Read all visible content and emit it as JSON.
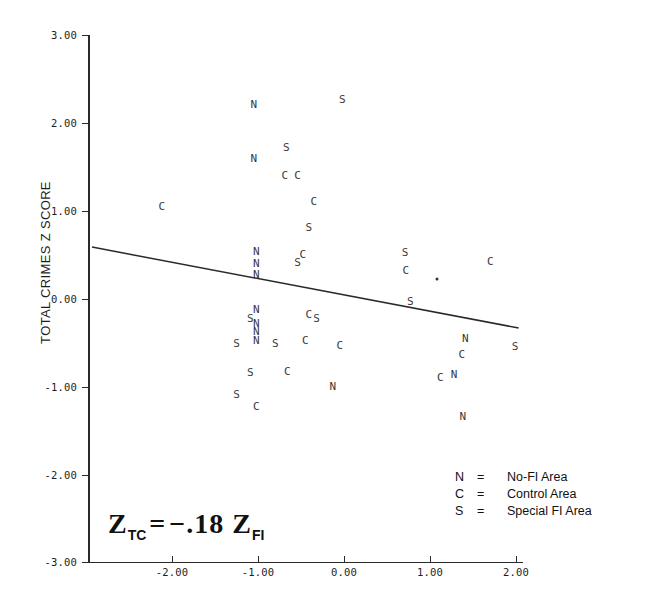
{
  "chart_data": {
    "type": "scatter",
    "title": "",
    "xlabel": "",
    "ylabel": "TOTAL CRIMES Z SCORE",
    "xlim": [
      -3.0,
      2.2
    ],
    "ylim": [
      -3.0,
      3.0
    ],
    "x_ticks": [
      "-2.00",
      "-1.00",
      "0.00",
      "1.00",
      "2.00"
    ],
    "x_tick_values": [
      -2.0,
      -1.0,
      0.0,
      1.0,
      2.0
    ],
    "y_ticks": [
      "3.00",
      "2.00",
      "1.00",
      "0.00",
      "-1.00",
      "-2.00",
      "-3.00"
    ],
    "y_tick_values": [
      3.0,
      2.0,
      1.0,
      0.0,
      -1.0,
      -2.0,
      -3.0
    ],
    "grid": false,
    "legend_position": "lower-right",
    "annotation": "Z_TC = -.18 Z_FI",
    "regression": {
      "slope": -0.18,
      "equation": "Z_TC = -.18 Z_FI",
      "x_start": -2.93,
      "y_start": 0.59,
      "x_end": 2.03,
      "y_end": -0.33
    },
    "series": [
      {
        "name": "No-FI Area",
        "marker": "N",
        "points": [
          {
            "x": -1.05,
            "y": 2.22
          },
          {
            "x": -1.05,
            "y": 1.6
          },
          {
            "x": -1.02,
            "y": 0.55
          },
          {
            "x": -1.02,
            "y": 0.41
          },
          {
            "x": -1.02,
            "y": 0.29
          },
          {
            "x": -1.02,
            "y": -0.11
          },
          {
            "x": -1.02,
            "y": -0.27
          },
          {
            "x": -1.02,
            "y": -0.36
          },
          {
            "x": -1.02,
            "y": -0.47
          },
          {
            "x": -0.13,
            "y": -0.99
          },
          {
            "x": 1.41,
            "y": -0.44
          },
          {
            "x": 1.28,
            "y": -0.85
          },
          {
            "x": 1.38,
            "y": -1.33
          }
        ]
      },
      {
        "name": "Control Area",
        "marker": "C",
        "points": [
          {
            "x": -2.12,
            "y": 1.06
          },
          {
            "x": -0.69,
            "y": 1.41
          },
          {
            "x": -0.54,
            "y": 1.41
          },
          {
            "x": -0.35,
            "y": 1.11
          },
          {
            "x": -0.48,
            "y": 0.51
          },
          {
            "x": -0.41,
            "y": -0.17
          },
          {
            "x": -0.45,
            "y": -0.46
          },
          {
            "x": -0.05,
            "y": -0.52
          },
          {
            "x": -0.66,
            "y": -0.82
          },
          {
            "x": -1.02,
            "y": -1.22
          },
          {
            "x": 0.72,
            "y": 0.33
          },
          {
            "x": 1.7,
            "y": 0.43
          },
          {
            "x": 1.37,
            "y": -0.63
          },
          {
            "x": 1.12,
            "y": -0.89
          }
        ]
      },
      {
        "name": "Special FI Area",
        "marker": "S",
        "points": [
          {
            "x": -0.02,
            "y": 2.27
          },
          {
            "x": -0.67,
            "y": 1.73
          },
          {
            "x": -0.41,
            "y": 0.82
          },
          {
            "x": -0.54,
            "y": 0.42
          },
          {
            "x": -1.09,
            "y": -0.22
          },
          {
            "x": -0.8,
            "y": -0.5
          },
          {
            "x": -0.32,
            "y": -0.21
          },
          {
            "x": -1.25,
            "y": -0.5
          },
          {
            "x": -1.09,
            "y": -0.83
          },
          {
            "x": -1.25,
            "y": -1.08
          },
          {
            "x": 0.77,
            "y": -0.02
          },
          {
            "x": 0.71,
            "y": 0.54
          },
          {
            "x": 1.99,
            "y": -0.53
          }
        ]
      },
      {
        "name": "Unlabeled point",
        "marker": "dot",
        "points": [
          {
            "x": 1.08,
            "y": 0.23
          }
        ]
      }
    ],
    "legend": [
      {
        "symbol": "N",
        "equals": "=",
        "description": "No-FI Area"
      },
      {
        "symbol": "C",
        "equals": "=",
        "description": "Control Area"
      },
      {
        "symbol": "S",
        "equals": "=",
        "description": "Special FI Area"
      }
    ]
  },
  "equation": {
    "z1": "Z",
    "sub1": "TC",
    "operator": "=",
    "value": "−.18",
    "z2": "Z",
    "sub2": "FI"
  },
  "colors": {
    "axis": "#2a2a2a",
    "marker": "#3a3a3a",
    "text": "#1a1a1a",
    "background": "#ffffff"
  }
}
